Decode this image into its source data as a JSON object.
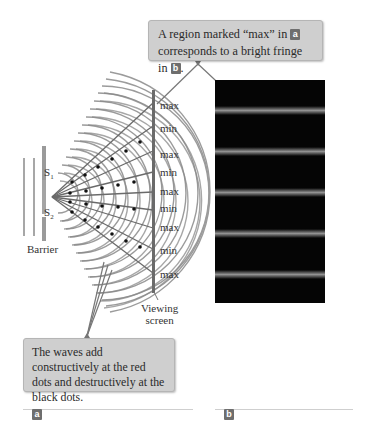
{
  "figure": {
    "callout_top": {
      "text_line1": "A region marked “max” in",
      "badge1": "a",
      "text_line2": "corresponds to a bright fringe in",
      "badge2": "b",
      "text_end": "."
    },
    "callout_bottom": {
      "text": "The waves add constructively at the red dots and destructively at the black dots."
    },
    "panel_a": {
      "sources": [
        "S1",
        "S2"
      ],
      "source_subscripts": [
        "1",
        "2"
      ],
      "barrier_label": "Barrier",
      "screen_label_line1": "Viewing",
      "screen_label_line2": "screen",
      "screen_markers": [
        "max",
        "min",
        "max",
        "min",
        "max",
        "min",
        "max",
        "min",
        "max"
      ]
    },
    "panel_b": {
      "bright_fringe_count": 5,
      "background_color": "#050505"
    },
    "part_labels": [
      "a",
      "b"
    ],
    "colors": {
      "callout_bg": "#cfcfcf",
      "wave_lines": "#7a7a7a",
      "badge_bg": "#6e6e6e"
    }
  }
}
